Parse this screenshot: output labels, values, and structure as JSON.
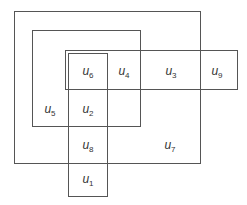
{
  "diagram": {
    "type": "set-venn-rectangles",
    "stroke_color": "#555555",
    "background": "#ffffff",
    "sets": [
      {
        "name": "outer-set",
        "x": 14,
        "y": 11,
        "w": 186,
        "h": 152
      },
      {
        "name": "middle-set",
        "x": 32,
        "y": 30,
        "w": 108,
        "h": 96
      },
      {
        "name": "horizontal-set",
        "x": 65,
        "y": 50,
        "w": 172,
        "h": 39
      },
      {
        "name": "vertical-set",
        "x": 68,
        "y": 53,
        "w": 39,
        "h": 143
      }
    ],
    "elements": [
      {
        "id": "u6",
        "base": "u",
        "sub": "6",
        "x": 88,
        "y": 72
      },
      {
        "id": "u4",
        "base": "u",
        "sub": "4",
        "x": 124,
        "y": 72
      },
      {
        "id": "u3",
        "base": "u",
        "sub": "3",
        "x": 171,
        "y": 72
      },
      {
        "id": "u9",
        "base": "u",
        "sub": "9",
        "x": 217,
        "y": 72
      },
      {
        "id": "u5",
        "base": "u",
        "sub": "5",
        "x": 50,
        "y": 110
      },
      {
        "id": "u2",
        "base": "u",
        "sub": "2",
        "x": 88,
        "y": 110
      },
      {
        "id": "u8",
        "base": "u",
        "sub": "8",
        "x": 88,
        "y": 146
      },
      {
        "id": "u7",
        "base": "u",
        "sub": "7",
        "x": 170,
        "y": 146
      },
      {
        "id": "u1",
        "base": "u",
        "sub": "1",
        "x": 88,
        "y": 180
      }
    ]
  }
}
